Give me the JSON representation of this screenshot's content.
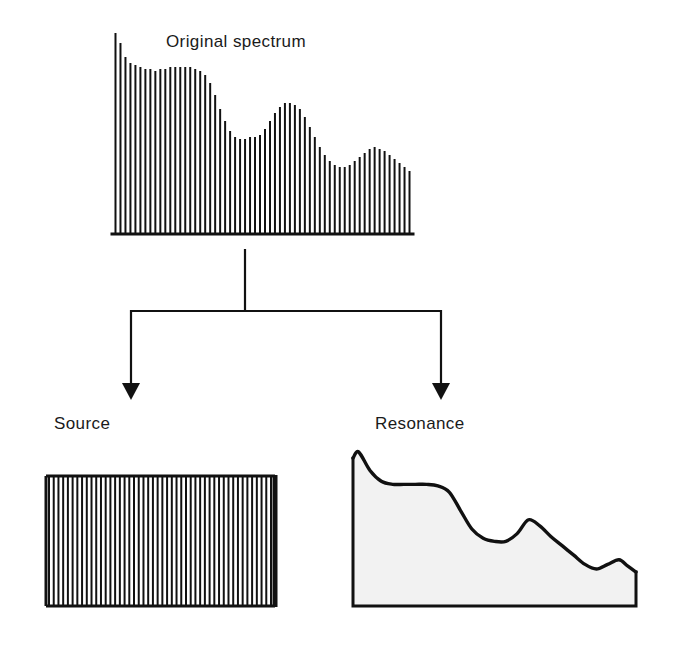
{
  "figure": {
    "title": "Original spectrum",
    "background_color": "#ffffff",
    "ink_color": "#111111",
    "fill_color": "#f2f2f2"
  },
  "labels": {
    "original_spectrum": "Original spectrum",
    "source": "Source",
    "resonance": "Resonance"
  },
  "chart_data": [
    {
      "id": "original-spectrum",
      "type": "bar",
      "title": "Original spectrum",
      "xlabel": "",
      "ylabel": "",
      "grid": false,
      "legend": "none",
      "description": "Harmonic line spectrum: equally spaced vertical lines whose tips trace a falling, undulating spectral envelope.",
      "axis_box": {
        "x0": 113,
        "y0": 33,
        "x1": 412,
        "y1": 233
      },
      "ylim": [
        0,
        100
      ],
      "categories": [
        "1",
        "2",
        "3",
        "4",
        "5",
        "6",
        "7",
        "8",
        "9",
        "10",
        "11",
        "12",
        "13",
        "14",
        "15",
        "16",
        "17",
        "18",
        "19",
        "20",
        "21",
        "22",
        "23",
        "24",
        "25",
        "26",
        "27",
        "28",
        "29",
        "30",
        "31",
        "32",
        "33",
        "34",
        "35",
        "36",
        "37",
        "38",
        "39",
        "40",
        "41",
        "42",
        "43",
        "44",
        "45",
        "46",
        "47",
        "48",
        "49",
        "50",
        "51",
        "52",
        "53",
        "54",
        "55",
        "56",
        "57",
        "58",
        "59",
        "60"
      ],
      "values": [
        100,
        95,
        88,
        85,
        84,
        83,
        82,
        82,
        81,
        82,
        82,
        83,
        83,
        83,
        83,
        83,
        82,
        81,
        79,
        75,
        69,
        62,
        56,
        51,
        48,
        47,
        47,
        48,
        48,
        49,
        52,
        56,
        60,
        63,
        65,
        65,
        64,
        62,
        58,
        53,
        48,
        43,
        39,
        36,
        34,
        33,
        33,
        34,
        36,
        38,
        40,
        42,
        43,
        42,
        41,
        39,
        37,
        35,
        33,
        31
      ]
    },
    {
      "id": "source",
      "type": "bar",
      "title": "Source",
      "xlabel": "",
      "ylabel": "",
      "grid": false,
      "legend": "none",
      "description": "Flat source spectrum: a filled rectangle of equal-height vertical harmonic lines, constant amplitude across all frequencies.",
      "axis_box": {
        "x0": 46,
        "y0": 476,
        "x1": 275,
        "y1": 606
      },
      "ylim": [
        0,
        100
      ],
      "line_count": 48,
      "values": [
        100,
        100,
        100,
        100,
        100,
        100,
        100,
        100,
        100,
        100,
        100,
        100,
        100,
        100,
        100,
        100,
        100,
        100,
        100,
        100,
        100,
        100,
        100,
        100,
        100,
        100,
        100,
        100,
        100,
        100,
        100,
        100,
        100,
        100,
        100,
        100,
        100,
        100,
        100,
        100,
        100,
        100,
        100,
        100,
        100,
        100,
        100,
        100
      ]
    },
    {
      "id": "resonance",
      "type": "area",
      "title": "Resonance",
      "xlabel": "",
      "ylabel": "",
      "grid": false,
      "legend": "none",
      "description": "Resonance (filter) envelope: a smooth shaded curve falling from a sharp left peak through a plateau, a step down, a mid hump and a small late bump.",
      "axis_box": {
        "x0": 353,
        "y0": 452,
        "x1": 636,
        "y1": 606
      },
      "ylim": [
        0,
        100
      ],
      "x": [
        0,
        2,
        6,
        10,
        14,
        18,
        22,
        26,
        30,
        34,
        38,
        42,
        46,
        50,
        54,
        58,
        62,
        66,
        70,
        74,
        78,
        82,
        86,
        90,
        94,
        97,
        100
      ],
      "values": [
        96,
        100,
        88,
        81,
        79,
        79,
        79,
        79,
        78,
        74,
        62,
        50,
        44,
        42,
        42,
        47,
        56,
        52,
        45,
        39,
        33,
        27,
        24,
        27,
        30,
        26,
        22
      ]
    }
  ],
  "connector": {
    "description": "Tree connector: a vertical stem descends from the original spectrum to a horizontal bar that branches into two down-arrows pointing at Source and Resonance.",
    "stem": {
      "x": 245,
      "y_top": 250,
      "y_bottom": 311
    },
    "crossbar": {
      "y": 311,
      "x_left": 131,
      "x_right": 441
    },
    "arrows": [
      {
        "target": "Source",
        "x": 131,
        "y_tip": 400
      },
      {
        "target": "Resonance",
        "x": 441,
        "y_tip": 400
      }
    ]
  }
}
